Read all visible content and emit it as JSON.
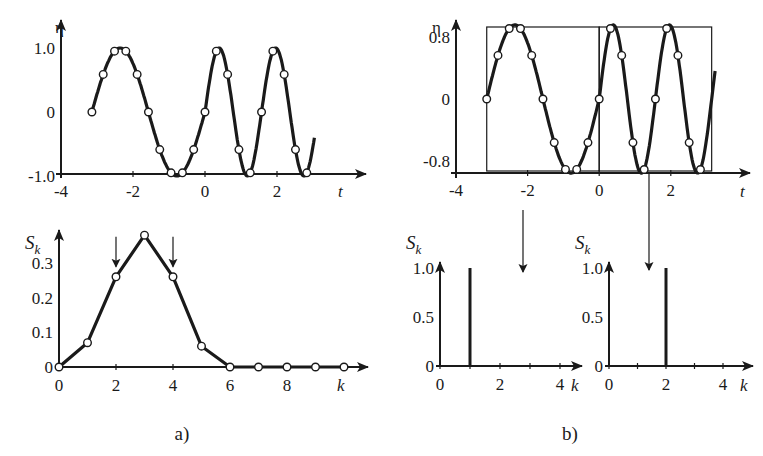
{
  "chart_data": [
    {
      "id": "a-signal",
      "type": "line",
      "title": "",
      "xlabel": "t",
      "ylabel": "η",
      "xlim": [
        -4,
        3.2
      ],
      "ylim": [
        -1.2,
        1.3
      ],
      "xticks": [
        -4,
        -2,
        0,
        2
      ],
      "xtick_labels": [
        "-4",
        "-2",
        "0",
        "2"
      ],
      "yticks": [
        1.0,
        0,
        -1.0
      ],
      "ytick_labels": [
        "1.0",
        "0",
        "-1.0"
      ],
      "curve_formula": "chirp",
      "samples": {
        "t": [
          -3.1416,
          -2.8274,
          -2.5133,
          -2.1991,
          -1.885,
          -1.5708,
          -1.2566,
          -0.9425,
          -0.6283,
          -0.3142,
          0.0,
          0.3142,
          0.6283,
          0.9425,
          1.2566,
          1.5708,
          1.885,
          2.1991,
          2.5133,
          2.8274
        ],
        "eta": [
          0.0,
          0.62,
          0.98,
          0.98,
          0.62,
          0.0,
          -0.62,
          -0.98,
          -0.98,
          -0.62,
          0.0,
          1.0,
          0.62,
          -0.62,
          -0.98,
          0.0,
          1.0,
          0.62,
          -0.62,
          -0.98
        ]
      }
    },
    {
      "id": "a-spectrum",
      "type": "line",
      "xlabel": "k",
      "ylabel": "S_k",
      "xlim": [
        0,
        10.5
      ],
      "ylim": [
        0,
        0.4
      ],
      "xticks": [
        0,
        2,
        4,
        6,
        8
      ],
      "xtick_labels": [
        "0",
        "2",
        "4",
        "6",
        "8"
      ],
      "yticks": [
        0,
        0.1,
        0.2,
        0.3
      ],
      "ytick_labels": [
        "0",
        "0.1",
        "0.2",
        "0.3"
      ],
      "x": [
        0,
        1,
        2,
        3,
        4,
        5,
        6,
        7,
        8,
        9,
        10
      ],
      "values": [
        0.0,
        0.07,
        0.26,
        0.38,
        0.26,
        0.06,
        0.0,
        0.0,
        0.0,
        0.0,
        0.0
      ],
      "annotations": [
        {
          "type": "arrow-down",
          "k": 2
        },
        {
          "type": "arrow-down",
          "k": 4
        }
      ]
    },
    {
      "id": "b-signal",
      "type": "line",
      "xlabel": "t",
      "ylabel": "η",
      "xlim": [
        -4,
        3.2
      ],
      "ylim": [
        -1.05,
        1.1
      ],
      "xticks": [
        -4,
        -2,
        0,
        2
      ],
      "xtick_labels": [
        "-4",
        "-2",
        "0",
        "2"
      ],
      "yticks": [
        0.8,
        0,
        -0.8
      ],
      "ytick_labels": [
        "0.8",
        "0",
        "-0.8"
      ],
      "windows": [
        [
          -3.1416,
          0
        ],
        [
          0,
          3.1416
        ]
      ],
      "curve_formula": "sin(2t) for t<0, sin(4t) for t>=0",
      "samples": {
        "t": [
          -3.1416,
          -2.8274,
          -2.5133,
          -2.1991,
          -1.885,
          -1.5708,
          -1.2566,
          -0.9425,
          -0.6283,
          -0.3142,
          0.0,
          0.3142,
          0.6283,
          0.9425,
          1.2566,
          1.5708,
          1.885,
          2.1991,
          2.5133,
          2.8274
        ],
        "eta": [
          0.0,
          0.59,
          0.95,
          0.95,
          0.59,
          0.0,
          -0.59,
          -0.95,
          -0.95,
          -0.59,
          0.0,
          0.95,
          0.59,
          -0.59,
          -0.95,
          0.0,
          0.95,
          0.59,
          -0.59,
          -0.95
        ]
      }
    },
    {
      "id": "b-spectrum-left",
      "type": "bar",
      "xlabel": "k",
      "ylabel": "S_k",
      "xlim": [
        0,
        4.6
      ],
      "ylim": [
        0,
        1.0
      ],
      "xticks": [
        0,
        2,
        4
      ],
      "xtick_labels": [
        "0",
        "2",
        "4"
      ],
      "yticks": [
        0,
        0.5,
        1.0
      ],
      "ytick_labels": [
        "0",
        "0.5",
        "1.0"
      ],
      "x": [
        1
      ],
      "values": [
        1.0
      ]
    },
    {
      "id": "b-spectrum-right",
      "type": "bar",
      "xlabel": "k",
      "ylabel": "S_k",
      "xlim": [
        0,
        4.6
      ],
      "ylim": [
        0,
        1.0
      ],
      "xticks": [
        0,
        2,
        4
      ],
      "xtick_labels": [
        "0",
        "2",
        "4"
      ],
      "yticks": [
        0,
        0.5,
        1.0
      ],
      "ytick_labels": [
        "0",
        "0.5",
        "1.0"
      ],
      "x": [
        2
      ],
      "values": [
        1.0
      ]
    }
  ],
  "captions": {
    "a": "a)",
    "b": "b)"
  },
  "labels": {
    "eta": "η",
    "t": "t",
    "k": "k",
    "S": "S",
    "sub_k": "k"
  }
}
